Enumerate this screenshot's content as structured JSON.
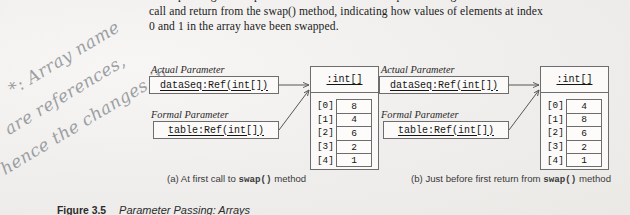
{
  "body_text": {
    "lines": [
      "corresponding formal parameter. This situation is depicted in Figure 3.5 at the first",
      "call and return from the swap() method, indicating how values of elements at index",
      "0 and 1 in the array have been swapped."
    ]
  },
  "annotation": {
    "line1": "*: Array name",
    "line2": "are references,",
    "line3": "hence the changes in",
    "line4": "method will reflect."
  },
  "diagrams": [
    {
      "id": "left",
      "actual_label": "Actual Parameter",
      "actual_value": "dataSeq:Ref(int[])",
      "formal_label": "Formal Parameter",
      "formal_value": "table:Ref(int[])",
      "object_title": ":int[]",
      "indices": [
        "[0]",
        "[1]",
        "[2]",
        "[3]",
        "[4]"
      ],
      "values": [
        "8",
        "4",
        "6",
        "2",
        "1"
      ],
      "caption_prefix": "(a) At first call to ",
      "caption_mono": "swap()",
      "caption_suffix": " method"
    },
    {
      "id": "right",
      "actual_label": "Actual Parameter",
      "actual_value": "dataSeq:Ref(int[])",
      "formal_label": "Formal Parameter",
      "formal_value": "table:Ref(int[])",
      "object_title": ":int[]",
      "indices": [
        "[0]",
        "[1]",
        "[2]",
        "[3]",
        "[4]"
      ],
      "values": [
        "4",
        "8",
        "6",
        "2",
        "1"
      ],
      "caption_prefix": "(b) Just before first return from ",
      "caption_mono": "swap()",
      "caption_suffix": " method"
    }
  ],
  "figure": {
    "number": "Figure 3.5",
    "title": "Parameter Passing: Arrays"
  },
  "colors": {
    "page": "#f2f1ef",
    "ink": "#1b1b1b",
    "box_stroke": "#6d6d6d",
    "handwriting": "#7b7f86"
  }
}
